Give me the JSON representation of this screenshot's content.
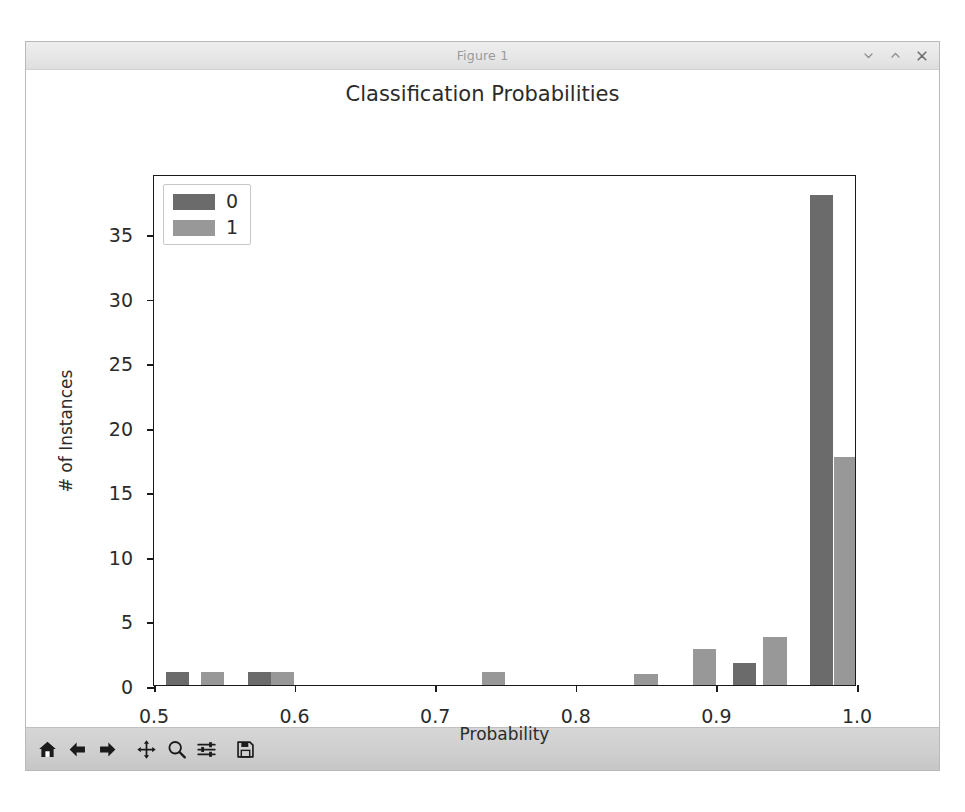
{
  "window": {
    "title": "Figure 1",
    "controls": [
      {
        "name": "minimize-button",
        "glyph": "chevron-down"
      },
      {
        "name": "maximize-button",
        "glyph": "chevron-up"
      },
      {
        "name": "close-button",
        "glyph": "x"
      }
    ]
  },
  "toolbar": {
    "buttons": [
      {
        "name": "home-button",
        "icon": "home-icon",
        "tooltip": "Reset original view"
      },
      {
        "name": "back-button",
        "icon": "arrow-left-icon",
        "tooltip": "Back to previous view"
      },
      {
        "name": "forward-button",
        "icon": "arrow-right-icon",
        "tooltip": "Forward to next view"
      },
      {
        "name": "pan-button",
        "icon": "move-icon",
        "tooltip": "Pan axes with left mouse, zoom with right"
      },
      {
        "name": "zoom-button",
        "icon": "magnifier-icon",
        "tooltip": "Zoom to rectangle"
      },
      {
        "name": "configure-subplots-button",
        "icon": "sliders-icon",
        "tooltip": "Configure subplots"
      },
      {
        "name": "save-button",
        "icon": "floppy-disk-icon",
        "tooltip": "Save the figure"
      }
    ]
  },
  "colors": {
    "series_0": "#6b6b6b",
    "series_1": "#989898",
    "axes_line": "#1a1a1a",
    "text": "#2b2b2b",
    "canvas": "#ffffff",
    "toolbar_bg": "#cfcfcf",
    "titlebar_bg": "#e8e8e8"
  },
  "chart_data": {
    "type": "bar",
    "title": "Classification Probabilities",
    "xlabel": "Probability",
    "ylabel": "# of Instances",
    "xlim": [
      0.5,
      1.0
    ],
    "ylim": [
      0,
      39.6
    ],
    "grid": false,
    "legend_position": "upper left",
    "xticks": [
      "0.5",
      "0.6",
      "0.7",
      "0.8",
      "0.9",
      "1.0"
    ],
    "xtick_values": [
      0.5,
      0.6,
      0.7,
      0.8,
      0.9,
      1.0
    ],
    "yticks": [
      "0",
      "5",
      "10",
      "15",
      "20",
      "25",
      "30",
      "35"
    ],
    "ytick_values": [
      0,
      5,
      10,
      15,
      20,
      25,
      30,
      35
    ],
    "bar_width": 0.0166,
    "series": [
      {
        "name": "0",
        "color": "#6b6b6b",
        "bars": [
          {
            "x": 0.5083,
            "value": 1
          },
          {
            "x": 0.5666,
            "value": 1
          },
          {
            "x": 0.9116,
            "value": 1.7
          },
          {
            "x": 0.9666,
            "value": 38
          }
        ]
      },
      {
        "name": "1",
        "color": "#989898",
        "bars": [
          {
            "x": 0.5333,
            "value": 1
          },
          {
            "x": 0.5833,
            "value": 1
          },
          {
            "x": 0.7333,
            "value": 1
          },
          {
            "x": 0.8416,
            "value": 0.85
          },
          {
            "x": 0.8833,
            "value": 2.8
          },
          {
            "x": 0.9333,
            "value": 3.7
          },
          {
            "x": 0.9833,
            "value": 17.7
          }
        ]
      }
    ]
  }
}
